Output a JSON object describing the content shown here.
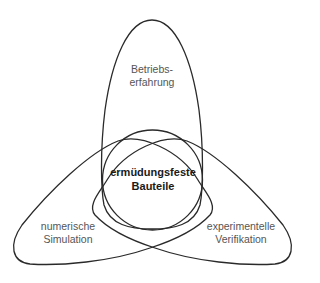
{
  "diagram": {
    "type": "three-lobe venn",
    "center": {
      "line1": "ermüdungsfeste",
      "line2": "Bauteile"
    },
    "lobes": [
      {
        "id": "top",
        "line1": "Betriebs-",
        "line2": "erfahrung"
      },
      {
        "id": "left",
        "line1": "numerische",
        "line2": "Simulation"
      },
      {
        "id": "right",
        "line1": "experimentelle",
        "line2": "Verifikation"
      }
    ],
    "colors": {
      "stroke": "#2a2a2a",
      "lobe_text": "#555555",
      "center_text": "#1a1a1a",
      "background": "#ffffff"
    }
  }
}
